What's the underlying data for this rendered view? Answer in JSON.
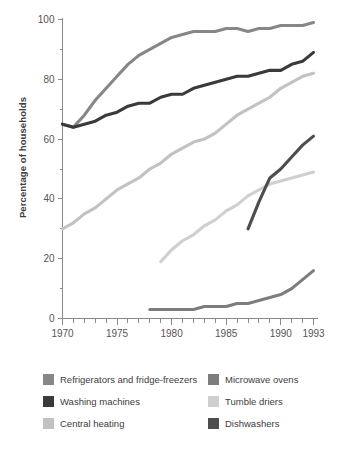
{
  "chart_data": {
    "type": "line",
    "title": "",
    "xlabel": "",
    "ylabel": "Percentage of households",
    "xlim": [
      1970,
      1993
    ],
    "ylim": [
      0,
      100
    ],
    "grid": false,
    "legend_position": "bottom",
    "x_ticks_major": [
      1970,
      1975,
      1980,
      1985,
      1990,
      1993
    ],
    "x_tick_labels": [
      "1970",
      "1975",
      "1980",
      "1985",
      "1990",
      "1993"
    ],
    "x_ticks_all": [
      1970,
      1971,
      1972,
      1973,
      1974,
      1975,
      1976,
      1977,
      1978,
      1979,
      1980,
      1981,
      1982,
      1983,
      1984,
      1985,
      1986,
      1987,
      1988,
      1989,
      1990,
      1991,
      1992,
      1993
    ],
    "y_ticks_major": [
      0,
      20,
      40,
      60,
      80,
      100
    ],
    "y_tick_labels": [
      "0",
      "20",
      "40",
      "60",
      "80",
      "100"
    ],
    "y_ticks_minor": [
      10,
      30,
      50,
      70,
      90
    ],
    "series": [
      {
        "name": "Refrigerators and fridge-freezers",
        "color": "#878787",
        "x": [
          1970,
          1971,
          1972,
          1973,
          1974,
          1975,
          1976,
          1977,
          1978,
          1979,
          1980,
          1981,
          1982,
          1983,
          1984,
          1985,
          1986,
          1987,
          1988,
          1989,
          1990,
          1991,
          1992,
          1993
        ],
        "values": [
          65,
          64,
          68,
          73,
          77,
          81,
          85,
          88,
          90,
          92,
          94,
          95,
          96,
          96,
          96,
          97,
          97,
          96,
          97,
          97,
          98,
          98,
          98,
          99
        ]
      },
      {
        "name": "Washing machines",
        "color": "#3a3a3a",
        "x": [
          1970,
          1971,
          1972,
          1973,
          1974,
          1975,
          1976,
          1977,
          1978,
          1979,
          1980,
          1981,
          1982,
          1983,
          1984,
          1985,
          1986,
          1987,
          1988,
          1989,
          1990,
          1991,
          1992,
          1993
        ],
        "values": [
          65,
          64,
          65,
          66,
          68,
          69,
          71,
          72,
          72,
          74,
          75,
          75,
          77,
          78,
          79,
          80,
          81,
          81,
          82,
          83,
          83,
          85,
          86,
          89
        ]
      },
      {
        "name": "Central heating",
        "color": "#c2c2c2",
        "x": [
          1970,
          1971,
          1972,
          1973,
          1974,
          1975,
          1976,
          1977,
          1978,
          1979,
          1980,
          1981,
          1982,
          1983,
          1984,
          1985,
          1986,
          1987,
          1988,
          1989,
          1990,
          1991,
          1992,
          1993
        ],
        "values": [
          30,
          32,
          35,
          37,
          40,
          43,
          45,
          47,
          50,
          52,
          55,
          57,
          59,
          60,
          62,
          65,
          68,
          70,
          72,
          74,
          77,
          79,
          81,
          82
        ]
      },
      {
        "name": "Microwave ovens",
        "color": "#7d7d7d",
        "x": [
          1978,
          1979,
          1980,
          1981,
          1982,
          1983,
          1984,
          1985,
          1986,
          1987,
          1988,
          1989,
          1990,
          1991,
          1992,
          1993
        ],
        "values": [
          3,
          3,
          3,
          3,
          3,
          4,
          4,
          4,
          5,
          5,
          6,
          7,
          8,
          10,
          13,
          16
        ]
      },
      {
        "name": "Tumble driers",
        "color": "#cfcfcf",
        "x": [
          1979,
          1980,
          1981,
          1982,
          1983,
          1984,
          1985,
          1986,
          1987,
          1988,
          1989,
          1990,
          1991,
          1992,
          1993
        ],
        "values": [
          19,
          23,
          26,
          28,
          31,
          33,
          36,
          38,
          41,
          43,
          45,
          46,
          47,
          48,
          49
        ]
      },
      {
        "name": "Dishwashers",
        "color": "#4d4d4d",
        "x": [
          1987,
          1988,
          1989,
          1990,
          1991,
          1992,
          1993
        ],
        "values": [
          30,
          39,
          47,
          50,
          54,
          58,
          61
        ]
      }
    ]
  },
  "legend": {
    "left_items": [
      {
        "label": "Refrigerators and fridge-freezers",
        "color": "#878787",
        "icon": "legend-swatch-refrigerators"
      },
      {
        "label": "Washing machines",
        "color": "#3a3a3a",
        "icon": "legend-swatch-washing-machines"
      },
      {
        "label": "Central heating",
        "color": "#c2c2c2",
        "icon": "legend-swatch-central-heating"
      }
    ],
    "right_items": [
      {
        "label": "Microwave ovens",
        "color": "#7d7d7d",
        "icon": "legend-swatch-microwave-ovens"
      },
      {
        "label": "Tumble driers",
        "color": "#cfcfcf",
        "icon": "legend-swatch-tumble-driers"
      },
      {
        "label": "Dishwashers",
        "color": "#4d4d4d",
        "icon": "legend-swatch-dishwashers"
      }
    ]
  }
}
